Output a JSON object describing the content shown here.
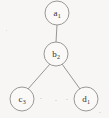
{
  "diagram": {
    "type": "tree",
    "background_color": "#f7f6f4",
    "node_fill_color": "#faf9f7",
    "node_stroke_color": "#8d8d8d",
    "edge_color": "#8a8a8a",
    "label_color": "#30302f",
    "node_radius": 12,
    "nodes": [
      {
        "id": "a1",
        "letter": "a",
        "subscript": "1",
        "label": "a1",
        "cx": 57,
        "cy": 13,
        "role": "root"
      },
      {
        "id": "b2",
        "letter": "b",
        "subscript": "2",
        "label": "b2",
        "cx": 56,
        "cy": 54,
        "role": "internal"
      },
      {
        "id": "c3",
        "letter": "c",
        "subscript": "3",
        "label": "c3",
        "cx": 22,
        "cy": 99,
        "role": "leaf"
      },
      {
        "id": "d1",
        "letter": "d",
        "subscript": "1",
        "label": "d1",
        "cx": 86,
        "cy": 99,
        "role": "leaf"
      }
    ],
    "edges": [
      {
        "id": "a1-b2",
        "from": "a1",
        "to": "b2",
        "x1": 57,
        "y1": 25,
        "x2": 56,
        "y2": 42
      },
      {
        "id": "b2-c3",
        "from": "b2",
        "to": "c3",
        "x1": 50,
        "y1": 64,
        "x2": 28,
        "y2": 89
      },
      {
        "id": "b2-d1",
        "from": "b2",
        "to": "d1",
        "x1": 62,
        "y1": 64,
        "x2": 80,
        "y2": 89
      }
    ]
  }
}
